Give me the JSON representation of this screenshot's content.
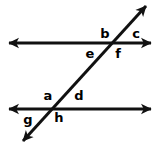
{
  "diagram": {
    "type": "geometry-angle-diagram",
    "stroke_color": "#111111",
    "background_color": "#ffffff",
    "stroke_width": 3,
    "lines": [
      {
        "name": "upper-parallel-line",
        "kind": "horizontal",
        "x1": 9,
        "y1": 43,
        "x2": 151,
        "y2": 43,
        "arrow_start": true,
        "arrow_end": true
      },
      {
        "name": "lower-parallel-line",
        "kind": "horizontal",
        "x1": 9,
        "y1": 109,
        "x2": 151,
        "y2": 109,
        "arrow_start": true,
        "arrow_end": true
      },
      {
        "name": "transversal-line",
        "kind": "diagonal",
        "x1": 23,
        "y1": 141,
        "x2": 146,
        "y2": 6,
        "arrow_start": true,
        "arrow_end": true
      }
    ],
    "intersections": [
      {
        "name": "upper-intersection",
        "x": 110,
        "y": 43
      },
      {
        "name": "lower-intersection",
        "x": 54,
        "y": 109
      }
    ],
    "labels": [
      {
        "id": "b",
        "text": "b",
        "x": 105,
        "y": 33,
        "at": "upper-intersection",
        "position": "upper-left"
      },
      {
        "id": "c",
        "text": "c",
        "x": 136,
        "y": 33,
        "at": "upper-intersection",
        "position": "upper-right"
      },
      {
        "id": "e",
        "text": "e",
        "x": 90,
        "y": 53,
        "at": "upper-intersection",
        "position": "lower-left"
      },
      {
        "id": "f",
        "text": "f",
        "x": 118,
        "y": 53,
        "at": "upper-intersection",
        "position": "lower-right"
      },
      {
        "id": "a",
        "text": "a",
        "x": 48,
        "y": 95,
        "at": "lower-intersection",
        "position": "upper-left"
      },
      {
        "id": "d",
        "text": "d",
        "x": 79,
        "y": 95,
        "at": "lower-intersection",
        "position": "upper-right"
      },
      {
        "id": "g",
        "text": "g",
        "x": 28,
        "y": 119,
        "at": "lower-intersection",
        "position": "lower-left"
      },
      {
        "id": "h",
        "text": "h",
        "x": 59,
        "y": 117,
        "at": "lower-intersection",
        "position": "lower-right"
      }
    ]
  }
}
